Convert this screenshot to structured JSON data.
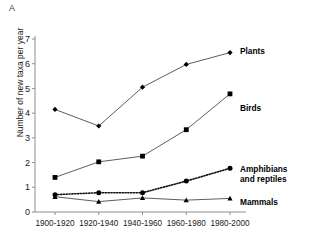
{
  "panel": {
    "label": "A"
  },
  "chart_data": {
    "type": "line",
    "title": "",
    "xlabel": "",
    "ylabel": "Number of new taxa per year",
    "categories": [
      "1900-1920",
      "1920-1940",
      "1940-1960",
      "1960-1980",
      "1980-2000"
    ],
    "ylim": [
      0,
      7
    ],
    "yticks": [
      0,
      1,
      2,
      3,
      4,
      5,
      6,
      7
    ],
    "ytick_labels": [
      "0",
      "1",
      "2",
      "3",
      "4",
      "5",
      "6",
      "7"
    ],
    "grid": false,
    "legend_position": "right-inline",
    "series": [
      {
        "name": "Plants",
        "marker": "diamond",
        "linestyle": "solid",
        "color": "#000000",
        "values": [
          4.15,
          3.48,
          5.05,
          5.97,
          6.45
        ]
      },
      {
        "name": "Birds",
        "marker": "square",
        "linestyle": "solid",
        "color": "#000000",
        "values": [
          1.4,
          2.03,
          2.26,
          3.33,
          4.78
        ]
      },
      {
        "name": "Amphibians and reptiles",
        "marker": "circle",
        "linestyle": "dotted",
        "color": "#000000",
        "values": [
          0.7,
          0.78,
          0.78,
          1.25,
          1.77
        ]
      },
      {
        "name": "Mammals",
        "marker": "triangle",
        "linestyle": "solid",
        "color": "#000000",
        "values": [
          0.62,
          0.42,
          0.57,
          0.48,
          0.55
        ]
      }
    ],
    "annotations": [
      {
        "text": "Plants",
        "series": "Plants"
      },
      {
        "text": "Birds",
        "series": "Birds"
      },
      {
        "text": "Amphibians",
        "series": "Amphibians and reptiles"
      },
      {
        "text": "and reptiles",
        "series": "Amphibians and reptiles"
      },
      {
        "text": "Mammals",
        "series": "Mammals"
      }
    ]
  }
}
